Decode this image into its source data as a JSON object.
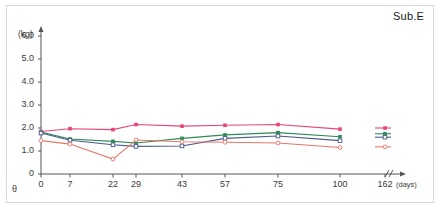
{
  "chart_data": {
    "type": "line",
    "title": "Sub.E",
    "xlabel": "(days)",
    "ylabel": "(kg)",
    "x": [
      0,
      7,
      22,
      29,
      43,
      57,
      75,
      100,
      162
    ],
    "xtick_labels": [
      "0",
      "7",
      "22",
      "29",
      "43",
      "57",
      "75",
      "100",
      "162"
    ],
    "ytick_labels": [
      "0",
      "1.0",
      "2.0",
      "3.0",
      "4.0",
      "5.0",
      "6.0"
    ],
    "ytick_values": [
      0,
      1.0,
      2.0,
      3.0,
      4.0,
      5.0,
      6.0
    ],
    "ylim": [
      0,
      6.3
    ],
    "grid": false,
    "legend": "none",
    "axis_break": {
      "between": [
        100,
        162
      ],
      "symbol": "//"
    },
    "corner_symbol": "θ",
    "series": [
      {
        "name": "series-magenta",
        "color": "#e8447a",
        "marker": "filled-square",
        "values": [
          1.85,
          1.97,
          1.93,
          2.15,
          2.08,
          2.12,
          2.15,
          1.95,
          2.0
        ]
      },
      {
        "name": "series-green",
        "color": "#2e8b57",
        "marker": "filled-square",
        "values": [
          1.82,
          1.52,
          1.42,
          1.35,
          1.55,
          1.7,
          1.8,
          1.62,
          1.75
        ]
      },
      {
        "name": "series-blue",
        "color": "#4a5a8a",
        "marker": "open-square",
        "values": [
          1.78,
          1.47,
          1.27,
          1.2,
          1.22,
          1.55,
          1.65,
          1.45,
          1.6
        ]
      },
      {
        "name": "series-salmon",
        "color": "#e8776a",
        "marker": "open-circle",
        "values": [
          1.45,
          1.3,
          0.65,
          1.48,
          1.4,
          1.38,
          1.35,
          1.15,
          1.18
        ]
      }
    ]
  }
}
